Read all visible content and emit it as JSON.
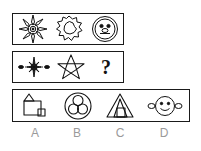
{
  "puzzle": {
    "type": "visual-analogy-matrix",
    "question_mark": "?",
    "rows": [
      {
        "name": "top-sequence-row",
        "cells": [
          {
            "icon": "starburst-flower-icon",
            "description": "many-pointed starburst flower with concentric center"
          },
          {
            "icon": "cloud-blob-icon",
            "description": "jagged cloud-like outline with inner wavy blob"
          },
          {
            "icon": "smiley-face-icon",
            "description": "circle face with two eyes and mouth"
          }
        ]
      },
      {
        "name": "bottom-sequence-row",
        "cells": [
          {
            "icon": "small-burst-with-side-ovals-icon",
            "description": "small burst star flanked by two small ovals"
          },
          {
            "icon": "five-point-star-icon",
            "description": "five pointed star outline with inner pentagon"
          },
          {
            "icon": "question-mark",
            "description": "answer placeholder"
          }
        ]
      }
    ],
    "options": [
      {
        "label": "A",
        "icon": "square-triangle-small-square-icon",
        "description": "square with triangle on top-left and small square at bottom-right"
      },
      {
        "label": "B",
        "icon": "circle-with-three-circles-icon",
        "description": "large circle containing three overlapping small circles"
      },
      {
        "label": "C",
        "icon": "triangle-with-inner-shapes-icon",
        "description": "large triangle with inner triangle and trapezoid"
      },
      {
        "label": "D",
        "icon": "face-with-side-ovals-icon",
        "description": "smiley face circle flanked by two small ovals"
      }
    ]
  }
}
